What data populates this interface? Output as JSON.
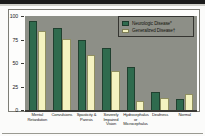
{
  "figure": {
    "background_color": "#fbfbfa",
    "plot_background_color": "#8d8f87"
  },
  "legend": {
    "position": "top-right-inside",
    "entries": [
      {
        "label": "Neurologic Disease*",
        "color": "#2f6b4e",
        "icon": "legend-swatch-icon"
      },
      {
        "label": "Generalized Disease†",
        "color": "#f4f3c0",
        "icon": "legend-swatch-icon"
      }
    ]
  },
  "chart_data": {
    "type": "bar",
    "title": "",
    "xlabel": "",
    "ylabel": "",
    "ylim": [
      0,
      100
    ],
    "yticks": [
      0,
      25,
      50,
      75,
      100
    ],
    "ytick_labels": [
      "0",
      "25",
      "50",
      "75",
      "100"
    ],
    "grid": false,
    "categories": [
      "Mental Retardation",
      "Convulsions",
      "Spasticity & Paresis",
      "Severely Impaired Vision",
      "Hydrocephalus or Microcephalus",
      "Deafness",
      "Normal"
    ],
    "series": [
      {
        "name": "Neurologic Disease*",
        "color": "#2f6b4e",
        "values": [
          95,
          87,
          75,
          66,
          46,
          19,
          12
        ]
      },
      {
        "name": "Generalized Disease†",
        "color": "#f4f3c0",
        "values": [
          84,
          76,
          58,
          42,
          10,
          13,
          17
        ]
      }
    ]
  }
}
